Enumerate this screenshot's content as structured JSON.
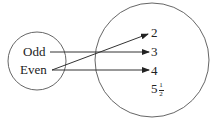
{
  "diagram": {
    "type": "mapping",
    "domain_set": {
      "label": "domain",
      "elements": [
        "Odd",
        "Even"
      ]
    },
    "range_set": {
      "label": "range",
      "elements": [
        "2",
        "3",
        "4",
        "5½"
      ],
      "fraction": {
        "whole": "5",
        "numerator": "1",
        "denominator": "2"
      }
    },
    "arrows": [
      {
        "from": "Odd",
        "to": "3"
      },
      {
        "from": "Even",
        "to": "2"
      },
      {
        "from": "Even",
        "to": "4"
      }
    ],
    "colors": {
      "stroke": "#333333",
      "circle": "#666666",
      "text": "#222222"
    }
  }
}
